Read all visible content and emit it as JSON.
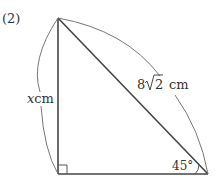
{
  "problem_number": "(2)",
  "figure": {
    "type": "right-triangle",
    "vertices": {
      "top": [
        58,
        18
      ],
      "right_angle": [
        58,
        174
      ],
      "bottom_right": [
        208,
        174
      ]
    },
    "hypotenuse_label": "8√2 cm",
    "hypotenuse_prefix": "8",
    "hypotenuse_radicand": "2",
    "hypotenuse_unit": "cm",
    "vertical_side_var": "x",
    "vertical_side_unit": "cm",
    "angle_label": "45°",
    "right_angle_marker": true,
    "colors": {
      "side": "#444444",
      "arc": "#777777",
      "text": "#333333"
    }
  }
}
